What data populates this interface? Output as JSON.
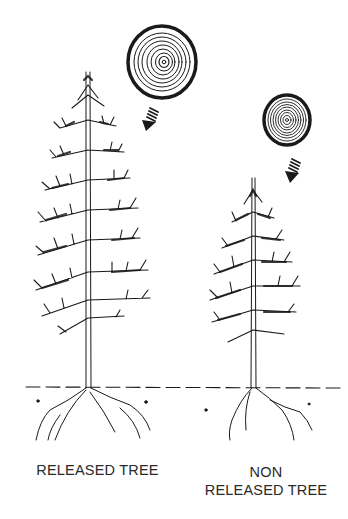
{
  "figure": {
    "colors": {
      "ink": "#1a1a1a",
      "background": "#ffffff",
      "label": "#2a2a2a"
    },
    "trees": [
      {
        "id": "released",
        "label": "RELEASED TREE",
        "ring_section": "wide-spaced growth rings",
        "arrow": "striped-arrow-down-left"
      },
      {
        "id": "non-released",
        "label_line1": "NON",
        "label_line2": "RELEASED TREE",
        "ring_section": "tight-spaced growth rings",
        "arrow": "striped-arrow-down-left"
      }
    ],
    "ground_line": "dashed"
  }
}
